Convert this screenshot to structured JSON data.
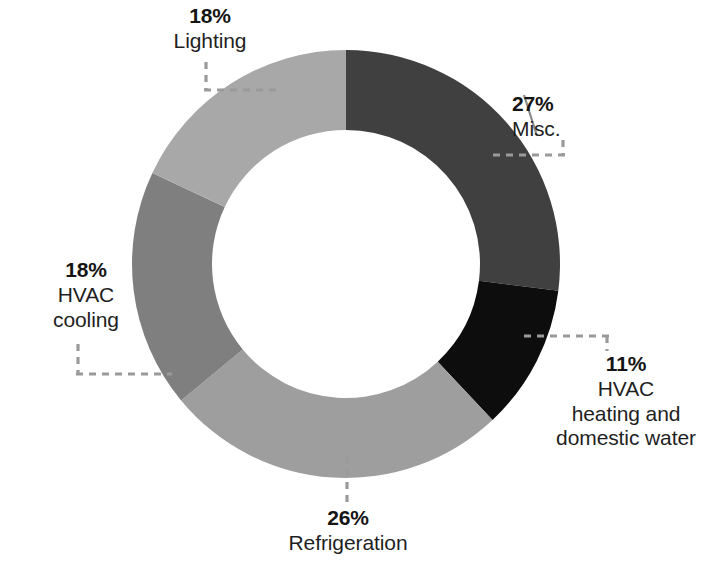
{
  "chart_data": {
    "type": "pie",
    "variant": "donut",
    "title": "",
    "subtitle": "",
    "xlabel": "",
    "ylabel": "",
    "units": "percent",
    "total": 100,
    "grid": false,
    "legend": "none",
    "label_style": "callout labels with dashed leader lines",
    "start_angle_deg": 0,
    "direction": "clockwise",
    "categories": [
      "Misc.",
      "HVAC heating and domestic water",
      "Refrigeration",
      "HVAC cooling",
      "Lighting"
    ],
    "values": [
      27,
      11,
      26,
      18,
      18
    ],
    "slices": [
      {
        "key": "misc",
        "label": "Misc.",
        "label_lines": [
          "Misc."
        ],
        "percent_text": "27%",
        "value": 27,
        "color": "#404040",
        "start_deg": 0,
        "end_deg": 97.2
      },
      {
        "key": "hvac-heating",
        "label": "HVAC heating and domestic water",
        "label_lines": [
          "HVAC",
          "heating and",
          "domestic water"
        ],
        "percent_text": "11%",
        "value": 11,
        "color": "#0d0d0d",
        "start_deg": 97.2,
        "end_deg": 136.8
      },
      {
        "key": "refrigeration",
        "label": "Refrigeration",
        "label_lines": [
          "Refrigeration"
        ],
        "percent_text": "26%",
        "value": 26,
        "color": "#9e9e9e",
        "start_deg": 136.8,
        "end_deg": 230.4
      },
      {
        "key": "hvac-cooling",
        "label": "HVAC cooling",
        "label_lines": [
          "HVAC",
          "cooling"
        ],
        "percent_text": "18%",
        "value": 18,
        "color": "#7f7f7f",
        "start_deg": 230.4,
        "end_deg": 295.2
      },
      {
        "key": "lighting",
        "label": "Lighting",
        "label_lines": [
          "Lighting"
        ],
        "percent_text": "18%",
        "value": 18,
        "color": "#a8a8a8",
        "start_deg": 295.2,
        "end_deg": 360
      }
    ],
    "geometry": {
      "center_x": 346,
      "center_y": 264,
      "outer_radius": 214,
      "inner_radius": 134
    },
    "colors": {
      "background": "#ffffff",
      "text": "#1a1a1a",
      "leader_line": "#9a9a9a"
    }
  },
  "labels": {
    "lighting": {
      "percent": "18%",
      "l1": "Lighting"
    },
    "misc": {
      "percent": "27%",
      "l1": "Misc."
    },
    "hvac_heating": {
      "percent": "11%",
      "l1": "HVAC",
      "l2": "heating and",
      "l3": "domestic water"
    },
    "refrigeration": {
      "percent": "26%",
      "l1": "Refrigeration"
    },
    "hvac_cooling": {
      "percent": "18%",
      "l1": "HVAC",
      "l2": "cooling"
    }
  }
}
